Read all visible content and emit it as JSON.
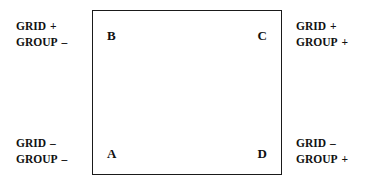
{
  "figure": {
    "type": "quadrant-sign-diagram",
    "background_color": "#ffffff",
    "line_color": "#1a1a1a",
    "text_color": "#111111"
  },
  "box": {
    "corners": {
      "bottom_left": "A",
      "top_left": "B",
      "top_right": "C",
      "bottom_right": "D"
    }
  },
  "labels": {
    "top_left": {
      "line1_term": "GRID",
      "line1_sign": "+",
      "line2_term": "GROUP",
      "line2_sign": "–"
    },
    "top_right": {
      "line1_term": "GRID",
      "line1_sign": "+",
      "line2_term": "GROUP",
      "line2_sign": "+"
    },
    "bottom_left": {
      "line1_term": "GRID",
      "line1_sign": "–",
      "line2_term": "GROUP",
      "line2_sign": "–"
    },
    "bottom_right": {
      "line1_term": "GRID",
      "line1_sign": "–",
      "line2_term": "GROUP",
      "line2_sign": "+"
    }
  }
}
